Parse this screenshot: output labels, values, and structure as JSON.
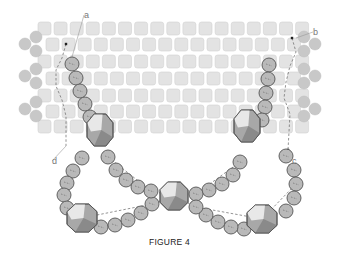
{
  "figure": {
    "caption": "FIGURE 4",
    "labels": [
      {
        "id": "a",
        "text": "a",
        "x": 84,
        "y": 14,
        "line_to": [
          72,
          57
        ]
      },
      {
        "id": "b",
        "text": "b",
        "x": 313,
        "y": 31,
        "line_to": [
          296,
          38
        ]
      },
      {
        "id": "c",
        "text": "c",
        "x": 292,
        "y": 160
      },
      {
        "id": "d",
        "text": "d",
        "x": 52,
        "y": 160,
        "line_to": [
          66,
          146
        ]
      }
    ],
    "grid": {
      "description": "Peyote-stitch band of square cylinder beads, 7 rows, alternating offset",
      "rows": [
        {
          "y": 22,
          "x_start": 38,
          "count": 17
        },
        {
          "y": 38,
          "x_start": 46,
          "count": 16
        },
        {
          "y": 55,
          "x_start": 38,
          "count": 17
        },
        {
          "y": 72,
          "x_start": 46,
          "count": 16
        },
        {
          "y": 89,
          "x_start": 38,
          "count": 17
        },
        {
          "y": 105,
          "x_start": 46,
          "count": 16
        },
        {
          "y": 120,
          "x_start": 38,
          "count": 17
        }
      ],
      "cell_size": 13,
      "pitch": 16.1,
      "color": "#e3e3e3",
      "border": "#d2d2d2"
    },
    "edge_picots": {
      "left": [
        [
          36,
          37
        ],
        [
          25,
          44
        ],
        [
          36,
          51
        ],
        [
          36,
          69
        ],
        [
          25,
          76
        ],
        [
          36,
          83
        ],
        [
          36,
          102
        ],
        [
          25,
          109
        ],
        [
          36,
          116
        ]
      ],
      "right": [
        [
          304,
          37
        ],
        [
          315,
          44
        ],
        [
          304,
          51
        ],
        [
          304,
          69
        ],
        [
          315,
          76
        ],
        [
          304,
          83
        ],
        [
          304,
          102
        ],
        [
          315,
          109
        ],
        [
          304,
          116
        ]
      ],
      "color": "#c8c8c8"
    },
    "round_beads": [
      [
        72,
        64
      ],
      [
        76,
        78
      ],
      [
        80,
        91
      ],
      [
        85,
        104
      ],
      [
        90,
        117
      ],
      [
        82,
        158
      ],
      [
        73,
        171
      ],
      [
        67,
        183
      ],
      [
        64,
        195
      ],
      [
        67,
        208
      ],
      [
        101,
        227
      ],
      [
        115,
        225
      ],
      [
        128,
        220
      ],
      [
        141,
        213
      ],
      [
        152,
        204
      ],
      [
        108,
        157
      ],
      [
        116,
        170
      ],
      [
        126,
        180
      ],
      [
        138,
        187
      ],
      [
        151,
        191
      ],
      [
        269,
        65
      ],
      [
        268,
        79
      ],
      [
        266,
        93
      ],
      [
        265,
        107
      ],
      [
        262,
        120
      ],
      [
        240,
        162
      ],
      [
        233,
        175
      ],
      [
        222,
        184
      ],
      [
        209,
        190
      ],
      [
        196,
        194
      ],
      [
        286,
        156
      ],
      [
        294,
        170
      ],
      [
        296,
        184
      ],
      [
        294,
        198
      ],
      [
        286,
        211
      ],
      [
        244,
        229
      ],
      [
        231,
        227
      ],
      [
        218,
        222
      ],
      [
        206,
        215
      ],
      [
        196,
        207
      ]
    ],
    "round_bead_radius": 7,
    "crystals": [
      {
        "x": 100,
        "y": 130,
        "w": 26,
        "h": 32
      },
      {
        "x": 82,
        "y": 218,
        "w": 30,
        "h": 28
      },
      {
        "x": 174,
        "y": 196,
        "w": 28,
        "h": 28
      },
      {
        "x": 247,
        "y": 126,
        "w": 26,
        "h": 32
      },
      {
        "x": 262,
        "y": 219,
        "w": 30,
        "h": 28
      }
    ],
    "colors": {
      "bead_fill": "#b9b9b9",
      "bead_stroke": "#555555",
      "crystal_dark": "#8a8a8a",
      "crystal_mid": "#a8a8a8",
      "crystal_light": "#e8e8e8",
      "thread": "#666666",
      "label": "#777777"
    }
  }
}
